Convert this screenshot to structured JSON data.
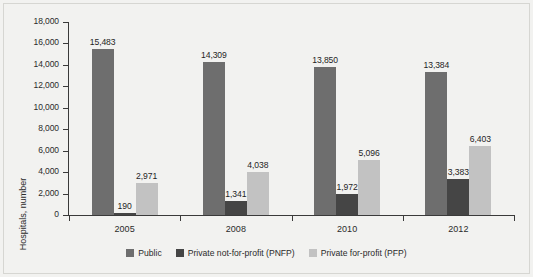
{
  "chart_data": {
    "type": "bar",
    "title": "",
    "subtitle": "",
    "xlabel": "",
    "ylabel": "Hospitals, number",
    "categories": [
      "2005",
      "2008",
      "2010",
      "2012"
    ],
    "series": [
      {
        "name": "Public",
        "color": "#6e6e6e",
        "values": [
          15483,
          14309,
          13850,
          13384
        ],
        "labels": [
          "15,483",
          "14,309",
          "13,850",
          "13,384"
        ]
      },
      {
        "name": "Private not-for-profit (PNFP)",
        "color": "#454545",
        "values": [
          190,
          1341,
          1972,
          3383
        ],
        "labels": [
          "190",
          "1,341",
          "1,972",
          "3,383"
        ]
      },
      {
        "name": "Private for-profit (PFP)",
        "color": "#c2c2c2",
        "values": [
          2971,
          4038,
          5096,
          6403
        ],
        "labels": [
          "2,971",
          "4,038",
          "5,096",
          "6,403"
        ]
      }
    ],
    "ylim": [
      0,
      18000
    ],
    "ytick_values": [
      0,
      2000,
      4000,
      6000,
      8000,
      10000,
      12000,
      14000,
      16000,
      18000
    ],
    "ytick_labels": [
      "0",
      "2,000",
      "4,000",
      "6,000",
      "8,000",
      "10,000",
      "12,000",
      "14,000",
      "16,000",
      "18,000"
    ],
    "grid": false,
    "legend_position": "bottom",
    "background_color": "#f2f2f0",
    "axis_color": "#3a3a3a",
    "text_color": "#2b2b2b"
  }
}
